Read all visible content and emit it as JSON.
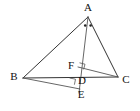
{
  "figure": {
    "background_color": "#ffffff",
    "line_color": "#333333",
    "label_color": "#111111",
    "width": 140,
    "height": 111
  },
  "labels": {
    "a": "A",
    "b": "B",
    "c": "C",
    "d": "D",
    "e": "E",
    "f": "F"
  },
  "points": {
    "A": {
      "x": 88,
      "y": 17
    },
    "B": {
      "x": 23,
      "y": 78
    },
    "C": {
      "x": 118,
      "y": 77
    },
    "D": {
      "x": 75,
      "y": 81
    },
    "E": {
      "x": 79,
      "y": 88
    },
    "F": {
      "x": 78,
      "y": 67
    }
  },
  "label_positions": {
    "A": {
      "x": 88,
      "y": 8
    },
    "B": {
      "x": 14,
      "y": 77
    },
    "C": {
      "x": 126,
      "y": 80
    },
    "D": {
      "x": 82,
      "y": 81
    },
    "E": {
      "x": 81,
      "y": 95
    },
    "F": {
      "x": 71,
      "y": 66
    }
  },
  "segments": [
    {
      "name": "segment-AB",
      "from": "A",
      "to": "B"
    },
    {
      "name": "segment-AC",
      "from": "A",
      "to": "C"
    },
    {
      "name": "segment-BC",
      "from": "B",
      "to": "C"
    },
    {
      "name": "segment-AE",
      "from": "A",
      "to": "E"
    },
    {
      "name": "segment-BE",
      "from": "B",
      "to": "E"
    },
    {
      "name": "segment-FC",
      "from": "F",
      "to": "C"
    }
  ],
  "angle_marks": {
    "vertex_A_equal_angle_dots": 2,
    "right_angles": [
      {
        "name": "right-angle-at-F",
        "at": "F"
      },
      {
        "name": "right-angle-at-D",
        "at": "D"
      }
    ]
  }
}
